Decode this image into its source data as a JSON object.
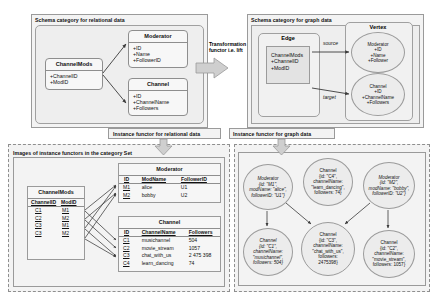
{
  "panels": {
    "schema_relational": "Schema category for relational data",
    "schema_graph": "Schema category for graph data",
    "instance_relational": "Instance functor for relational data",
    "instance_graph": "Instance functor for graph data",
    "images_set": "Images of instance functors in the category Set"
  },
  "transformation": {
    "label_line1": "Transformation",
    "label_line2": "functor i.e. lift"
  },
  "schema_relational": {
    "channelmods": {
      "name": "ChannelMods",
      "attrs": [
        "+ChannelID",
        "+ModID"
      ]
    },
    "moderator": {
      "name": "Moderator",
      "attrs": [
        "+ID",
        "+Name",
        "+FollowerID"
      ]
    },
    "channel": {
      "name": "Channel",
      "attrs": [
        "+ID",
        "+ChannelName",
        "+Followers"
      ]
    }
  },
  "schema_graph": {
    "edge_label": "Edge",
    "vertex_label": "Vertex",
    "edge_block": [
      "ChannelMods",
      "+ChannelID",
      "+ModID"
    ],
    "source_label": "source",
    "target_label": "target",
    "moderator_vertex": [
      "Moderator",
      "+ID",
      "+Name",
      "+Follower"
    ],
    "channel_vertex": [
      "Channel",
      "+ID",
      "+ChannelName",
      "+Followers"
    ]
  },
  "tables": {
    "channelmods": {
      "caption": "ChannelMods",
      "headers": [
        "ChannelID",
        "ModID"
      ],
      "rows": [
        [
          "C1",
          "M1"
        ],
        [
          "C2",
          "M2"
        ],
        [
          "C3",
          "M1"
        ],
        [
          "C3",
          "M2"
        ]
      ]
    },
    "moderator": {
      "caption": "Moderator",
      "headers": [
        "ID",
        "ModName",
        "FollowerID"
      ],
      "rows": [
        [
          "M1",
          "alice",
          "U1"
        ],
        [
          "M2",
          "bobby",
          "U2"
        ]
      ]
    },
    "channel": {
      "caption": "Channel",
      "headers": [
        "ID",
        "ChannelName",
        "Followers"
      ],
      "rows": [
        [
          "C1",
          "musichannel",
          "504"
        ],
        [
          "C2",
          "movie_stream",
          "1057"
        ],
        [
          "C3",
          "chat_with_us",
          "2 475 398"
        ],
        [
          "C4",
          "learn_dancing",
          "74"
        ]
      ]
    }
  },
  "graph_nodes": {
    "m1": [
      "Moderator",
      "{id: \"M1\",",
      "modName: \"alice\",",
      "followerID: \"U1\"}"
    ],
    "m2": [
      "Moderator",
      "{id: \"M2\",",
      "modName: \"bobby\",",
      "followerID: \"U2\"}"
    ],
    "c4": [
      "Channel",
      "{id: \"C4\",",
      "channelName:",
      "\"learn_dancing\",",
      "followers: 74}"
    ],
    "c1": [
      "Channel",
      "{id: \"C1\",",
      "channelName:",
      "\"musichannel\",",
      "followers: 504}"
    ],
    "c3": [
      "Channel",
      "{id: \"C3\",",
      "channelName:",
      "\"chat_with_us\",",
      "followers:",
      "2475398}"
    ],
    "c2": [
      "Channel",
      "{id: \"C2\",",
      "channelName:",
      "\"movie_stream\",",
      "followers: 1057}"
    ]
  },
  "colors": {
    "panel_bg": "#f3f3f3",
    "box_bg": "#f7f7f7",
    "ellipse_bg": "#ececec",
    "border": "#9a9a9a",
    "arrow": "#3a3a3a"
  }
}
